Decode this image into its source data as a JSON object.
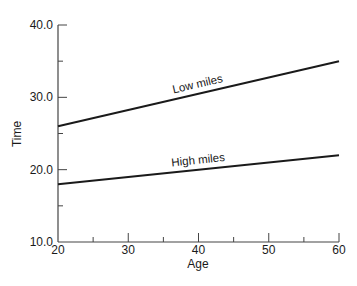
{
  "chart_data": {
    "type": "line",
    "title": "",
    "xlabel": "Age",
    "ylabel": "Time",
    "xlim": [
      20,
      60
    ],
    "ylim": [
      10,
      40
    ],
    "x_ticks": [
      20,
      30,
      40,
      50,
      60
    ],
    "x_minor_ticks": [
      25,
      35,
      45,
      55
    ],
    "x_tick_labels": [
      "20",
      "30",
      "40",
      "50",
      "60"
    ],
    "y_ticks": [
      10,
      20,
      30,
      40
    ],
    "y_minor_ticks": [
      15,
      25,
      35
    ],
    "y_tick_labels": [
      "10.0",
      "20.0",
      "30.0",
      "40.0"
    ],
    "grid": false,
    "legend": "none (inline line labels)",
    "series": [
      {
        "name": "Low miles",
        "x": [
          20,
          60
        ],
        "values": [
          26,
          35
        ],
        "label_at_x": 40
      },
      {
        "name": "High miles",
        "x": [
          20,
          60
        ],
        "values": [
          18,
          22
        ],
        "label_at_x": 40
      }
    ]
  }
}
